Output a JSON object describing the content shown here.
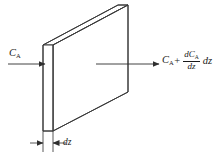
{
  "figure": {
    "background_color": "#ffffff",
    "line_color": "#3a3a3a",
    "text_color": "#1a1a1a"
  },
  "labels": {
    "inlet": {
      "symbol": "C",
      "subscript": "A",
      "full_text": "C_A"
    },
    "outlet": {
      "base_symbol": "C",
      "base_subscript": "A",
      "operator": "+",
      "fraction_numerator_d": "d",
      "fraction_numerator_symbol": "C",
      "fraction_numerator_subscript": "A",
      "fraction_denominator_d": "d",
      "fraction_denominator_var": "z",
      "trailing_d": "d",
      "trailing_var": "z",
      "full_text": "C_A + (dC_A/dz) dz"
    },
    "thickness": {
      "d": "d",
      "var": "z",
      "full_text": "dz"
    }
  },
  "geometry": {
    "slab_front_face": {
      "top_left_x": 43,
      "top_left_y": 45,
      "top_right_x": 53,
      "top_right_y": 45,
      "bottom_right_x": 53,
      "bottom_right_y": 131,
      "bottom_left_x": 43,
      "bottom_left_y": 131
    },
    "slab_depth_offset_x": 75,
    "slab_depth_offset_y": -40,
    "thickness_dim_left_x": 43,
    "thickness_dim_right_x": 53,
    "thickness_dim_y": 143
  },
  "arrows": {
    "inlet_arrow": {
      "x1": 8,
      "y1": 64,
      "x2": 45,
      "y2": 64,
      "direction": "right"
    },
    "outlet_arrow": {
      "x1": 96,
      "y1": 64,
      "x2": 159,
      "y2": 64,
      "direction": "right"
    }
  }
}
